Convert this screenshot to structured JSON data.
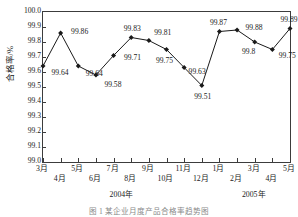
{
  "chart_data": {
    "type": "line",
    "title": "",
    "xlabel": "",
    "ylabel": "合格率/%",
    "ylim": [
      99.0,
      100.0
    ],
    "ystep": 0.1,
    "ytick_labels": [
      "100.0",
      "99.9",
      "99.8",
      "99.7",
      "99.6",
      "99.5",
      "99.4",
      "99.3",
      "99.2",
      "99.1",
      "99.0"
    ],
    "grid": false,
    "legend": "none",
    "marker": "diamond",
    "line_color": "#1a1a1a",
    "marker_color": "#1a1a1a",
    "categories": [
      "3月",
      "4月",
      "5月",
      "6月",
      "7月",
      "8月",
      "9月",
      "10月",
      "11月",
      "12月",
      "1月",
      "2月",
      "3月",
      "4月",
      "5月"
    ],
    "values": [
      99.64,
      99.86,
      99.64,
      99.58,
      99.71,
      99.83,
      99.81,
      99.75,
      99.63,
      99.51,
      99.87,
      99.88,
      99.8,
      99.75,
      99.89
    ],
    "data_labels": [
      "99.64",
      "99.86",
      "99.64",
      "99.58",
      "99.71",
      "99.83",
      "99.81",
      "99.75",
      "99.63",
      "99.51",
      "99.87",
      "99.88",
      "99.8",
      "99.75",
      "99.89"
    ],
    "label_offsets": [
      {
        "dx": 17,
        "dy": 7
      },
      {
        "dx": 19,
        "dy": -1
      },
      {
        "dx": 16,
        "dy": 8
      },
      {
        "dx": 17,
        "dy": 10
      },
      {
        "dx": 19,
        "dy": 2
      },
      {
        "dx": 1,
        "dy": -9
      },
      {
        "dx": 14,
        "dy": -8
      },
      {
        "dx": -2,
        "dy": 11
      },
      {
        "dx": 13,
        "dy": 4
      },
      {
        "dx": 1,
        "dy": 11
      },
      {
        "dx": -1,
        "dy": -9
      },
      {
        "dx": 17,
        "dy": -2
      },
      {
        "dx": -6,
        "dy": 10
      },
      {
        "dx": 15,
        "dy": 6
      },
      {
        "dx": -1,
        "dy": -9
      }
    ],
    "groups": [
      {
        "label": "2004年",
        "start": 0,
        "end": 9
      },
      {
        "label": "2005年",
        "start": 10,
        "end": 14
      }
    ]
  },
  "caption": "图 1  某企业月度产品合格率趋势图"
}
